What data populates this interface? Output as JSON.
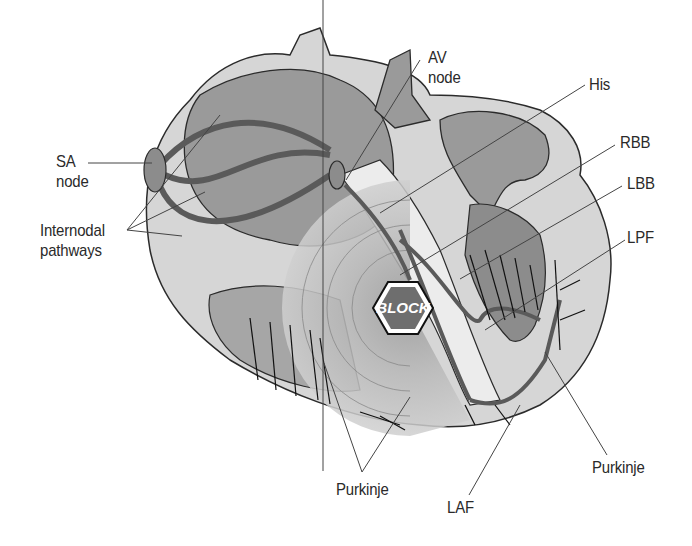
{
  "diagram": {
    "block_badge": {
      "text": "BLOCK",
      "shape": "hexagon",
      "fill": "#6e6e6e",
      "border": "#111111"
    },
    "labels": {
      "sa_node": [
        "SA",
        "node"
      ],
      "internodal": [
        "Internodal",
        "pathways"
      ],
      "av_node": [
        "AV",
        "node"
      ],
      "his": "His",
      "rbb": "RBB",
      "lbb": "LBB",
      "lpf": "LPF",
      "purkinje_left": "Purkinje",
      "purkinje_right": "Purkinje",
      "laf": "LAF"
    },
    "colors": {
      "tissue_dark": "#8c8c8c",
      "tissue_mid": "#a6a6a6",
      "tissue_light": "#d4d4d4",
      "wall_white": "#ececec",
      "outline": "#2b2b2b",
      "leader_line": "#444444"
    }
  }
}
